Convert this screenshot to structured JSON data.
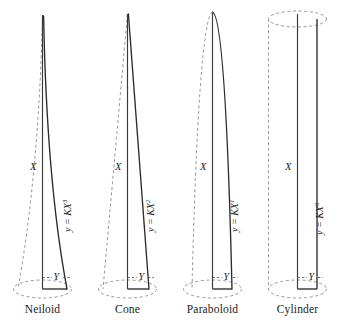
{
  "figure": {
    "background": "#ffffff",
    "solid_stroke": "#2b2b2b",
    "dashed_stroke": "#8c8c8c",
    "axis_stroke": "#3a3a3a",
    "text_color": "#1a1a1a"
  },
  "shapes": [
    {
      "name": "Neiloid",
      "equation_base": "y = KX",
      "exponent": "3",
      "axis_label": "X",
      "radius_label": "Y",
      "profile_type": "neiloid",
      "apex": "pointed-concave",
      "base_half_width": 18,
      "top_half_width": 0.8
    },
    {
      "name": "Cone",
      "equation_base": "y = KX",
      "exponent": "2",
      "axis_label": "X",
      "radius_label": "Y",
      "profile_type": "cone",
      "apex": "pointed-straight",
      "base_half_width": 18,
      "top_half_width": 0.8
    },
    {
      "name": "Paraboloid",
      "equation_base": "y = KX",
      "exponent": "1",
      "axis_label": "X",
      "radius_label": "Y",
      "profile_type": "paraboloid",
      "apex": "rounded",
      "base_half_width": 18,
      "top_half_width": 1.0
    },
    {
      "name": "Cylinder",
      "equation_base": "y = KX",
      "exponent": "0",
      "axis_label": "X",
      "radius_label": "Y",
      "profile_type": "cylinder",
      "apex": "flat-ellipse",
      "base_half_width": 18,
      "top_half_width": 18
    }
  ]
}
